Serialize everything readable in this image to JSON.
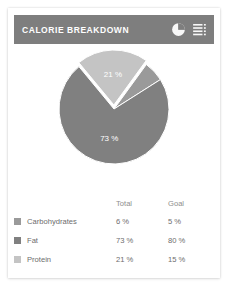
{
  "card": {
    "header": {
      "title": "CALORIE BREAKDOWN",
      "pie_icon_name": "pie-chart-icon",
      "menu_icon_name": "list-menu-icon",
      "background_color": "#7e7e7e",
      "title_color": "#ffffff"
    }
  },
  "chart_data": {
    "type": "pie",
    "title": "CALORIE BREAKDOWN",
    "categories": [
      "Carbohydrates",
      "Fat",
      "Protein"
    ],
    "values": [
      6,
      73,
      21
    ],
    "value_unit": "%",
    "goals": [
      5,
      80,
      15
    ],
    "colors": [
      "#9a9a9a",
      "#808080",
      "#c4c4c4"
    ],
    "legend_position": "bottom",
    "grid": false,
    "slice_labels": [
      {
        "text": "73 %",
        "category": "Fat"
      },
      {
        "text": "21 %",
        "category": "Protein"
      }
    ],
    "exploded_slice": "Protein"
  },
  "legend": {
    "headers": {
      "name": "",
      "total": "Total",
      "goal": "Goal"
    },
    "rows": [
      {
        "label": "Carbohydrates",
        "total": "6 %",
        "goal": "5 %",
        "color": "#9a9a9a"
      },
      {
        "label": "Fat",
        "total": "73 %",
        "goal": "80 %",
        "color": "#808080"
      },
      {
        "label": "Protein",
        "total": "21 %",
        "goal": "15 %",
        "color": "#c4c4c4"
      }
    ]
  }
}
